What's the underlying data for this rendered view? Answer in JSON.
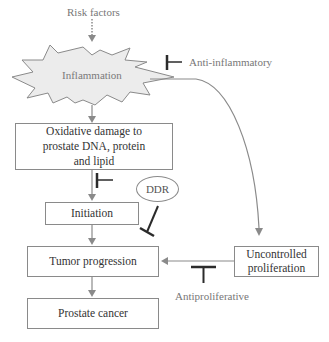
{
  "diagram": {
    "type": "flowchart",
    "topic": "Inflammation-driven prostate carcinogenesis",
    "nodes": {
      "risk_factors": "Risk factors",
      "inflammation": "Inflammation",
      "oxidative_damage": "Oxidative damage to prostate DNA, protein and lipid",
      "oxidative_damage_lines": [
        "Oxidative damage to",
        "prostate DNA, protein",
        "and lipid"
      ],
      "initiation": "Initiation",
      "tumor_progression": "Tumor progression",
      "prostate_cancer": "Prostate cancer",
      "uncontrolled_proliferation_lines": [
        "Uncontrolled",
        "proliferation"
      ],
      "ddr": "DDR"
    },
    "inhibitors": {
      "anti_inflammatory": "Anti-inflammatory",
      "antiproliferative": "Antiproliferative"
    },
    "edges": [
      {
        "from": "Risk factors",
        "to": "Inflammation",
        "style": "dotted-arrow"
      },
      {
        "from": "Inflammation",
        "to": "Oxidative damage",
        "style": "arrow"
      },
      {
        "from": "Inflammation",
        "to": "Uncontrolled proliferation",
        "style": "curved-arrow"
      },
      {
        "from": "Oxidative damage",
        "to": "Initiation",
        "style": "arrow"
      },
      {
        "from": "Initiation",
        "to": "Tumor progression",
        "style": "arrow"
      },
      {
        "from": "Uncontrolled proliferation",
        "to": "Tumor progression",
        "style": "arrow"
      },
      {
        "from": "Tumor progression",
        "to": "Prostate cancer",
        "style": "arrow"
      },
      {
        "from": "Anti-inflammatory",
        "to": "Inflammation",
        "style": "inhibit"
      },
      {
        "from": "(unlabeled)",
        "to": "Oxidative damage to Initiation",
        "style": "inhibit"
      },
      {
        "from": "DDR",
        "to": "Tumor progression",
        "style": "inhibit"
      },
      {
        "from": "Antiproliferative",
        "to": "Uncontrolled proliferation to Tumor progression",
        "style": "inhibit"
      }
    ],
    "colors": {
      "line": "#8a8a8a",
      "inhibitor": "#2b2b2b",
      "burst_fill": "#ececec",
      "text": "#333333"
    }
  }
}
